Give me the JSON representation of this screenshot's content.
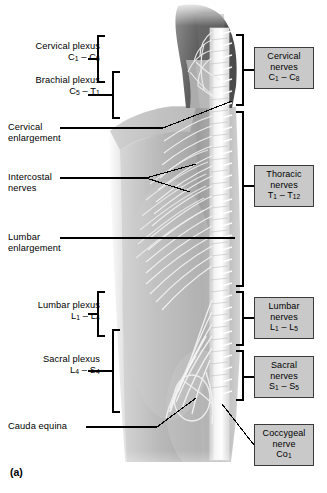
{
  "figure": {
    "panel_tag": "(a)",
    "title_hidden": ""
  },
  "left_labels": [
    {
      "name": "cervical-plexus",
      "line1": "Cervical plexus",
      "line2": "C",
      "sub1": "1",
      "dash": " – ",
      "line2b": "C",
      "sub2": "5",
      "x": 8,
      "y": 41,
      "w": 92,
      "two_line": true
    },
    {
      "name": "brachial-plexus",
      "line1": "Brachial plexus",
      "line2": "C",
      "sub1": "5",
      "dash": " – ",
      "line2b": "T",
      "sub2": "1",
      "x": 8,
      "y": 75,
      "w": 92,
      "two_line": true
    },
    {
      "name": "cervical-enlargement",
      "line1": "Cervical",
      "line2": "enlargement",
      "x": 8,
      "y": 122,
      "w": 76,
      "two_line": true,
      "plain2": true
    },
    {
      "name": "intercostal-nerves",
      "line1": "Intercostal",
      "line2": "nerves",
      "x": 8,
      "y": 168,
      "w": 76,
      "two_line": true,
      "plain2": true
    },
    {
      "name": "lumbar-enlargement",
      "line1": "Lumbar",
      "line2": "enlargement",
      "x": 8,
      "y": 232,
      "w": 76,
      "two_line": true,
      "plain2": true
    },
    {
      "name": "lumbar-plexus",
      "line1": "Lumbar plexus",
      "line2": "L",
      "sub1": "1",
      "dash": " – ",
      "line2b": "L",
      "sub2": "4",
      "x": 8,
      "y": 300,
      "w": 92,
      "two_line": true
    },
    {
      "name": "sacral-plexus",
      "line1": "Sacral plexus",
      "line2": "L",
      "sub1": "4",
      "dash": " – ",
      "line2b": "S",
      "sub2": "4",
      "x": 8,
      "y": 354,
      "w": 92,
      "two_line": true
    },
    {
      "name": "cauda-equina",
      "line1": "Cauda equina",
      "x": 8,
      "y": 421,
      "w": 92,
      "two_line": false
    }
  ],
  "right_boxes": [
    {
      "name": "cervical-nerves-box",
      "line1": "Cervical",
      "line2": "nerves",
      "seg": "C",
      "sub1": "1",
      "dash": " – ",
      "seg2": "C",
      "sub2": "8",
      "x": 254,
      "y": 47,
      "w": 60,
      "h": 42
    },
    {
      "name": "thoracic-nerves-box",
      "line1": "Thoracic",
      "line2": "nerves",
      "seg": "T",
      "sub1": "1",
      "dash": " – ",
      "seg2": "T",
      "sub2": "12",
      "x": 254,
      "y": 165,
      "w": 60,
      "h": 42
    },
    {
      "name": "lumbar-nerves-box",
      "line1": "Lumbar",
      "line2": "nerves",
      "seg": "L",
      "sub1": "1",
      "dash": " – ",
      "seg2": "L",
      "sub2": "5",
      "x": 254,
      "y": 297,
      "w": 60,
      "h": 42
    },
    {
      "name": "sacral-nerves-box",
      "line1": "Sacral",
      "line2": "nerves",
      "seg": "S",
      "sub1": "1",
      "dash": " – ",
      "seg2": "S",
      "sub2": "5",
      "x": 254,
      "y": 356,
      "w": 60,
      "h": 42
    },
    {
      "name": "coccygeal-nerve-box",
      "line1": "Coccygeal",
      "line2": "nerve",
      "seg": "Co",
      "sub1": "1",
      "dash": "",
      "seg2": "",
      "sub2": "",
      "x": 254,
      "y": 424,
      "w": 60,
      "h": 42
    }
  ],
  "colors": {
    "box_fill": "#c9c9c9",
    "box_border": "#3a3a3a",
    "leader": "#000000",
    "skin_light": "#d8d8d8",
    "skin_mid": "#a9a9a9",
    "skin_dark": "#6e6e6e",
    "hair_dark": "#4a4a4a",
    "nerve": "#f2f2f2",
    "background": "#ffffff"
  }
}
